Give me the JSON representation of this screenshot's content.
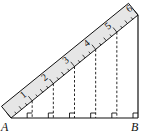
{
  "diagram": {
    "points": {
      "A": {
        "label": "A"
      },
      "B": {
        "label": "B"
      }
    },
    "ruler": {
      "marks": [
        "1",
        "2",
        "3",
        "4",
        "5",
        "6"
      ],
      "fill": "#e6e6e6"
    },
    "perpendicular_count": 5,
    "right_angle_marks": 6
  }
}
